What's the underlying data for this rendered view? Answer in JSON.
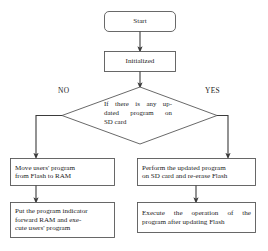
{
  "diagram": {
    "type": "flowchart",
    "stroke_color": "#404040",
    "text_color": "#1d1d1d",
    "background_color": "#ffffff",
    "nodes": {
      "start": {
        "shape": "rounded-rectangle",
        "label": "Start"
      },
      "initialized": {
        "shape": "rectangle",
        "label": "Initialized"
      },
      "decision": {
        "shape": "diamond",
        "line1": "If there is any up-",
        "line2": "dated program on",
        "line3": "SD card",
        "full_label": "If there is any updated program on SD card"
      },
      "move_program": {
        "shape": "rectangle",
        "line1": "Move users' program",
        "line2": "from Flash to RAM",
        "full_label": "Move users' program from Flash to RAM"
      },
      "put_indicator": {
        "shape": "rectangle",
        "line1": "Put the program indicator",
        "line2": "forward RAM and exe-",
        "line3": "cute users' program",
        "full_label": "Put the program indicator forward RAM and execute users' program"
      },
      "perform_update": {
        "shape": "rectangle",
        "line1": "Perform the updated program",
        "line2": "on SD card and re-erase Flash",
        "full_label": "Perform the updated program on SD card and re-erase Flash"
      },
      "execute_after": {
        "shape": "rectangle",
        "line1": "Execute the operation of the",
        "line2": "program after updating Flash",
        "full_label": "Execute the operation of the program after updating Flash"
      }
    },
    "branches": {
      "no_label": "NO",
      "yes_label": "YES"
    }
  }
}
